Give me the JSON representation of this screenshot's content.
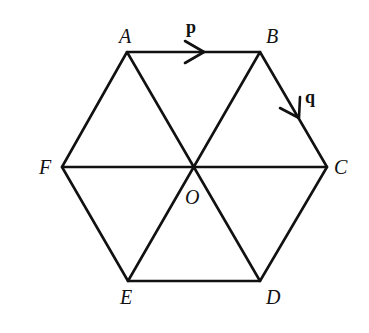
{
  "diagram": {
    "vertices": {
      "A": {
        "label": "A",
        "x": 127,
        "y": 52
      },
      "B": {
        "label": "B",
        "x": 260,
        "y": 52
      },
      "C": {
        "label": "C",
        "x": 327,
        "y": 167
      },
      "D": {
        "label": "D",
        "x": 260,
        "y": 281
      },
      "E": {
        "label": "E",
        "x": 128,
        "y": 281
      },
      "F": {
        "label": "F",
        "x": 62,
        "y": 167
      },
      "O": {
        "label": "O",
        "x": 193,
        "y": 167
      }
    },
    "vectors": {
      "p": {
        "label": "p",
        "from": "A",
        "to": "B"
      },
      "q": {
        "label": "q",
        "from": "B",
        "to": "C"
      }
    },
    "colors": {
      "stroke": "#111111",
      "background": "#ffffff"
    }
  }
}
